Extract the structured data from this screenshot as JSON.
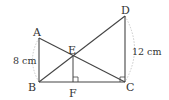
{
  "diagram": {
    "type": "geometry",
    "points": {
      "A": {
        "label": "A"
      },
      "B": {
        "label": "B"
      },
      "C": {
        "label": "C"
      },
      "D": {
        "label": "D"
      },
      "E": {
        "label": "E"
      },
      "F": {
        "label": "F"
      }
    },
    "segments": [
      "AB",
      "BC",
      "CD",
      "AC",
      "BD",
      "EF"
    ],
    "right_angles": [
      "EFC",
      "BCD"
    ],
    "measurements": {
      "AB": "8 cm",
      "CD": "12 cm"
    },
    "colors": {
      "line": "#444444",
      "arc": "#bbbbbb",
      "text": "#333333"
    }
  }
}
